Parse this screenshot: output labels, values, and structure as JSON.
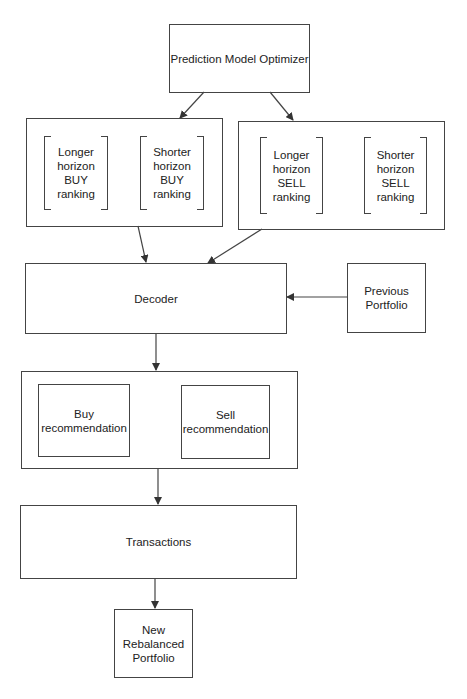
{
  "diagram": {
    "nodes": {
      "optimizer": "Prediction Model Optimizer",
      "buy_long": "Longer\nhorizon\nBUY\nranking",
      "buy_short": "Shorter\nhorizon\nBUY\nranking",
      "sell_long": "Longer\nhorizon\nSELL\nranking",
      "sell_short": "Shorter\nhorizon\nSELL\nranking",
      "decoder": "Decoder",
      "previous_portfolio": "Previous\nPortfolio",
      "buy_rec": "Buy\nrecommendation",
      "sell_rec": "Sell\nrecommendation",
      "transactions": "Transactions",
      "new_portfolio": "New\nRebalanced\nPortfolio"
    },
    "edges": [
      {
        "from": "optimizer",
        "to": "buy_rankings_group"
      },
      {
        "from": "optimizer",
        "to": "sell_rankings_group"
      },
      {
        "from": "buy_rankings_group",
        "to": "decoder"
      },
      {
        "from": "sell_rankings_group",
        "to": "decoder"
      },
      {
        "from": "previous_portfolio",
        "to": "decoder"
      },
      {
        "from": "decoder",
        "to": "recommendations_group"
      },
      {
        "from": "recommendations_group",
        "to": "transactions"
      },
      {
        "from": "transactions",
        "to": "new_portfolio"
      }
    ],
    "colors": {
      "line": "#444444",
      "background": "#ffffff"
    }
  }
}
